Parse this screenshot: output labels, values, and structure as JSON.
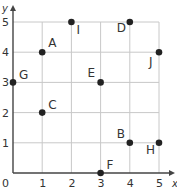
{
  "chart_data": {
    "type": "scatter",
    "title": "",
    "xlabel": "x",
    "ylabel": "y",
    "xlim": [
      0,
      5
    ],
    "ylim": [
      0,
      5
    ],
    "grid": true,
    "x_ticks": [
      "0",
      "1",
      "2",
      "3",
      "4",
      "5"
    ],
    "y_ticks": [
      "1",
      "2",
      "3",
      "4",
      "5"
    ],
    "origin_label": "0",
    "points": [
      {
        "label": "A",
        "x": 1,
        "y": 4
      },
      {
        "label": "B",
        "x": 4,
        "y": 1
      },
      {
        "label": "C",
        "x": 1,
        "y": 2
      },
      {
        "label": "D",
        "x": 4,
        "y": 5
      },
      {
        "label": "E",
        "x": 3,
        "y": 3
      },
      {
        "label": "F",
        "x": 3,
        "y": 0
      },
      {
        "label": "G",
        "x": 0,
        "y": 3
      },
      {
        "label": "H",
        "x": 5,
        "y": 1
      },
      {
        "label": "I",
        "x": 2,
        "y": 5
      },
      {
        "label": "J",
        "x": 5,
        "y": 4
      }
    ],
    "colors": {
      "grid": "#c8c8c8",
      "axis": "#444444",
      "point": "#222222",
      "text": "#333333"
    }
  }
}
